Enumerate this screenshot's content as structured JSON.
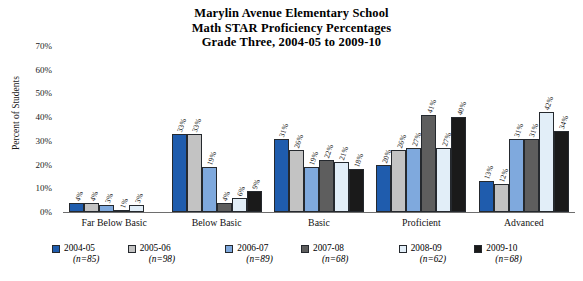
{
  "chart_data": {
    "type": "bar",
    "title": "Marylin Avenue Elementary School Math STAR Proficiency Percentages Grade Three, 2004-05 to 2009-10",
    "title_lines": [
      "Marylin Avenue Elementary School",
      "Math STAR Proficiency Percentages",
      "Grade Three, 2004-05 to 2009-10"
    ],
    "xlabel": "",
    "ylabel": "Percent of Students",
    "ylim": [
      0,
      70
    ],
    "ytick_labels": [
      "0%",
      "10%",
      "20%",
      "30%",
      "40%",
      "50%",
      "60%",
      "70%"
    ],
    "ytick_values": [
      0,
      10,
      20,
      30,
      40,
      50,
      60,
      70
    ],
    "grid": false,
    "legend_position": "bottom",
    "categories": [
      "Far Below Basic",
      "Below Basic",
      "Basic",
      "Proficient",
      "Advanced"
    ],
    "series": [
      {
        "name": "2004-05",
        "n_label": "(n=85)",
        "color": "#1F5CAD",
        "values": [
          4,
          33,
          31,
          20,
          13
        ],
        "value_labels": [
          "4%",
          "33%",
          "31%",
          "20%",
          "13%"
        ]
      },
      {
        "name": "2005-06",
        "n_label": "(n=98)",
        "color": "#C3C3C3",
        "values": [
          4,
          33,
          26,
          26,
          12
        ],
        "value_labels": [
          "4%",
          "33%",
          "26%",
          "26%",
          "12%"
        ]
      },
      {
        "name": "2006-07",
        "n_label": "(n=89)",
        "color": "#7FA9DD",
        "values": [
          3,
          19,
          19,
          27,
          31
        ],
        "value_labels": [
          "3%",
          "19%",
          "19%",
          "27%",
          "31%"
        ]
      },
      {
        "name": "2007-08",
        "n_label": "(n=68)",
        "color": "#5E5E5E",
        "values": [
          1,
          4,
          22,
          41,
          31
        ],
        "value_labels": [
          "1%",
          "4%",
          "22%",
          "41%",
          "31%"
        ]
      },
      {
        "name": "2008-09",
        "n_label": "(n=62)",
        "color": "#E2EEF8",
        "values": [
          3,
          6,
          21,
          27,
          42
        ],
        "value_labels": [
          "3%",
          "6%",
          "21%",
          "27%",
          "42%"
        ]
      },
      {
        "name": "2009-10",
        "n_label": "(n=68)",
        "color": "#1A1A1A",
        "values": [
          0,
          9,
          18,
          40,
          34
        ],
        "value_labels": [
          "",
          "9%",
          "18%",
          "40%",
          "34%"
        ]
      }
    ]
  }
}
